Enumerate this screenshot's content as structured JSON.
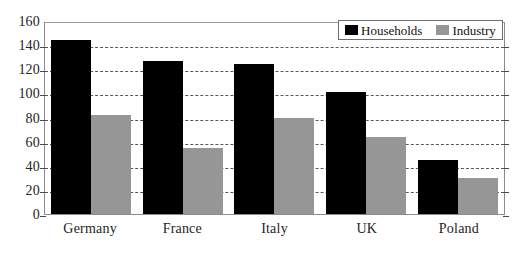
{
  "chart_data": {
    "type": "bar",
    "title": "",
    "subtitle": "",
    "xlabel": "",
    "ylabel": "",
    "categories": [
      "Germany",
      "France",
      "Italy",
      "UK",
      "Poland"
    ],
    "series": [
      {
        "name": "Households",
        "color": "#000000",
        "values": [
          144,
          127,
          124,
          101,
          45
        ]
      },
      {
        "name": "Industry",
        "color": "#969696",
        "values": [
          82,
          55,
          80,
          64,
          30
        ]
      }
    ],
    "ylim": [
      0,
      160
    ],
    "ytick_step": 20,
    "yticks": [
      0,
      20,
      40,
      60,
      80,
      100,
      120,
      140,
      160
    ],
    "ytick_labels": [
      "0",
      "20",
      "40",
      "60",
      "80",
      "100",
      "120",
      "140",
      "160"
    ],
    "grid": true,
    "grid_style": "dashed",
    "grid_axis": "y",
    "legend_position": "top-right",
    "legend_entries": [
      "Households",
      "Industry"
    ],
    "bar_mode": "grouped",
    "annotations": []
  },
  "legend": {
    "items": [
      {
        "label": "Households",
        "swatch": "black-square-icon"
      },
      {
        "label": "Industry",
        "swatch": "gray-square-icon"
      }
    ]
  },
  "colors": {
    "households": "#000000",
    "industry": "#969696",
    "grid": "#585858",
    "frame": "#8c8c8c",
    "text": "#242424",
    "background": "#ffffff"
  }
}
